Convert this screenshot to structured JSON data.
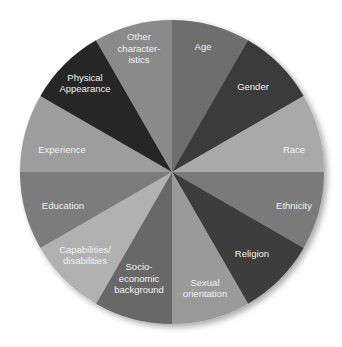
{
  "chart_data": {
    "type": "pie",
    "title": "",
    "categories": [
      "Age",
      "Gender",
      "Race",
      "Ethnicity",
      "Religion",
      "Sexual orientation",
      "Socio-economic background",
      "Capabilities/ disabilities",
      "Education",
      "Experience",
      "Physical Appearance",
      "Other characteristics"
    ],
    "values": [
      1,
      1,
      1,
      1,
      1,
      1,
      1,
      1,
      1,
      1,
      1,
      1
    ],
    "start_angle_deg": 0,
    "direction": "clockwise",
    "legend": "none (labels inside slices)",
    "slices": [
      {
        "label_lines": [
          "Age"
        ],
        "color": "#6e6e6e"
      },
      {
        "label_lines": [
          "Gender"
        ],
        "color": "#3a3a3a"
      },
      {
        "label_lines": [
          "Race"
        ],
        "color": "#a9a9a9"
      },
      {
        "label_lines": [
          "Ethnicity"
        ],
        "color": "#7a7a7a"
      },
      {
        "label_lines": [
          "Religion"
        ],
        "color": "#3c3c3c"
      },
      {
        "label_lines": [
          "Sexual",
          "orientation"
        ],
        "color": "#9a9a9a"
      },
      {
        "label_lines": [
          "Socio-",
          "economic",
          "background"
        ],
        "color": "#686868"
      },
      {
        "label_lines": [
          "Capabilities/",
          "disabilities"
        ],
        "color": "#b1b1b1"
      },
      {
        "label_lines": [
          "Education"
        ],
        "color": "#7c7c7c"
      },
      {
        "label_lines": [
          "Experience"
        ],
        "color": "#9d9d9d"
      },
      {
        "label_lines": [
          "Physical",
          "Appearance"
        ],
        "color": "#262626"
      },
      {
        "label_lines": [
          "Other",
          "character-",
          "istics"
        ],
        "color": "#8a8a8a"
      }
    ]
  }
}
